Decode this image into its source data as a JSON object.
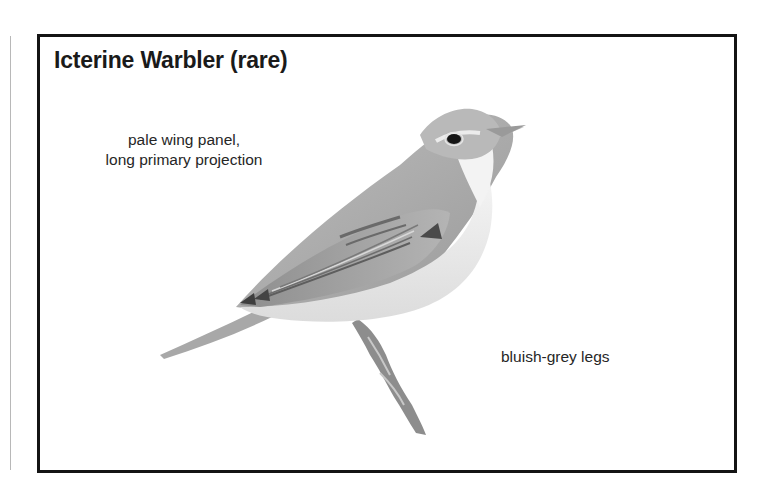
{
  "plate": {
    "title": "Icterine Warbler (rare)",
    "annotations": [
      {
        "lines": [
          "pale wing panel,",
          "long primary projection"
        ]
      },
      {
        "lines": [
          "bluish-grey legs"
        ]
      }
    ],
    "illustration": {
      "subject": "icterine-warbler",
      "style": "greyscale"
    }
  },
  "colors": {
    "frame": "#141414",
    "text": "#1a1a1a",
    "background": "#ffffff"
  }
}
